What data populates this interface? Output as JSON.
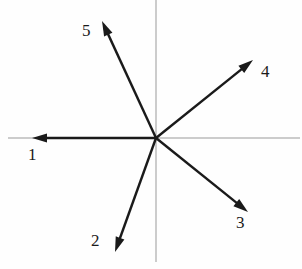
{
  "figure": {
    "type": "vector-diagram",
    "width": 302,
    "height": 269,
    "background_color": "#fefefe",
    "origin": {
      "x": 156,
      "y": 138
    },
    "axes": {
      "axis_color": "#9a9a9a",
      "axis_width": 1,
      "horizontal": {
        "x1": 8,
        "y1": 138,
        "x2": 300,
        "y2": 138
      },
      "vertical": {
        "x1": 156,
        "y1": 0,
        "x2": 156,
        "y2": 262
      }
    },
    "vector_color": "#1a1a1a",
    "vector_width": 2.4,
    "vectors": [
      {
        "label": "1",
        "tip": {
          "x": 32,
          "y": 138
        },
        "angle_deg": 180,
        "length_px": 124,
        "label_pos": {
          "x": 28,
          "y": 146
        }
      },
      {
        "label": "2",
        "tip": {
          "x": 115,
          "y": 252
        },
        "angle_deg": 250,
        "length_px": 121,
        "label_pos": {
          "x": 91,
          "y": 232
        }
      },
      {
        "label": "3",
        "tip": {
          "x": 248,
          "y": 212
        },
        "angle_deg": -37,
        "length_px": 116,
        "label_pos": {
          "x": 236,
          "y": 214
        }
      },
      {
        "label": "4",
        "tip": {
          "x": 253,
          "y": 60
        },
        "angle_deg": 42,
        "length_px": 130,
        "label_pos": {
          "x": 261,
          "y": 63
        }
      },
      {
        "label": "5",
        "tip": {
          "x": 102,
          "y": 21
        },
        "angle_deg": 113,
        "length_px": 127,
        "label_pos": {
          "x": 82,
          "y": 22
        }
      }
    ]
  }
}
